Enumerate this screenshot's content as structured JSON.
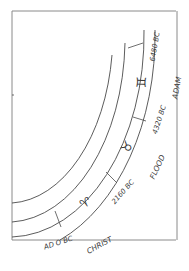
{
  "diagram": {
    "title": "",
    "ages": [
      {
        "sign": "Gemini",
        "glyph": "♊",
        "start_label": "6480 BC",
        "end_label": "4320 BC",
        "event": "ADAM"
      },
      {
        "sign": "Taurus",
        "glyph": "♉",
        "start_label": "4320 BC",
        "end_label": "2160 BC",
        "event": "FLOOD"
      },
      {
        "sign": "Aries",
        "glyph": "♈",
        "start_label": "2160 BC",
        "end_label": "AD 0 BC",
        "event": "CHRIST"
      }
    ],
    "labels": {
      "date_6480": "6480 BC",
      "date_4320": "4320 BC",
      "date_2160": "2160 BC",
      "date_0": "AD O BC",
      "event_adam": "ADAM",
      "event_flood": "FLOOD",
      "event_christ": "CHRIST",
      "glyph_gemini": "♊",
      "glyph_taurus": "♉",
      "glyph_aries": "♈"
    },
    "colors": {
      "line": "#4a4a4a",
      "frame": "#8a8a8a",
      "background": "#ffffff"
    }
  }
}
